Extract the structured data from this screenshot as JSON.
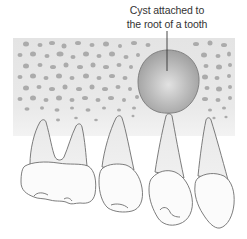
{
  "diagram": {
    "type": "anatomical-illustration",
    "label": {
      "line1": "Cyst attached to",
      "line2": "the root of a tooth"
    },
    "elements": [
      {
        "name": "bone",
        "description": "spongy jaw bone with trabecular pattern"
      },
      {
        "name": "cyst",
        "description": "round grey cyst attached to the root tip of a tooth"
      },
      {
        "name": "molar",
        "description": "two-rooted molar, leftmost"
      },
      {
        "name": "premolar-1",
        "description": "single-rooted premolar"
      },
      {
        "name": "premolar-2",
        "description": "tooth whose root tip touches the cyst"
      },
      {
        "name": "canine",
        "description": "rightmost long-rooted tooth"
      }
    ],
    "colors": {
      "bone_top": "#e6e6e6",
      "bone_bottom": "#f2f2f2",
      "trabeculae": "#a9a9a9",
      "cyst_fill": "#a6a6a6",
      "cyst_highlight": "#dcdcdc",
      "outline": "#6e6e6e",
      "tooth_fill": "#fbfbfb"
    }
  }
}
